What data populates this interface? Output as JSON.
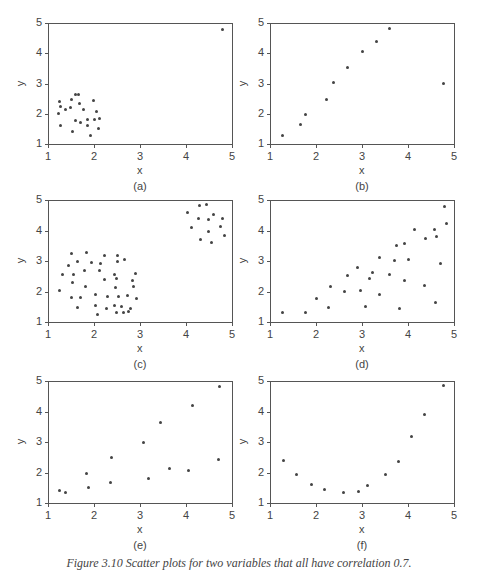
{
  "figure": {
    "caption": "Figure 3.10   Scatter plots for two variables that all have correlation 0.7.",
    "axis_color": "#555555",
    "point_color": "#444444"
  },
  "chart_data": [
    {
      "type": "scatter",
      "panel_label": "(a)",
      "xlabel": "x",
      "ylabel": "y",
      "xlim": [
        1,
        5
      ],
      "ylim": [
        1,
        5
      ],
      "xticks": [
        "1",
        "2",
        "3",
        "4",
        "5"
      ],
      "yticks": [
        "1",
        "2",
        "3",
        "4",
        "5"
      ],
      "grid": false,
      "points": [
        [
          4.8,
          4.78
        ],
        [
          1.26,
          2.39
        ],
        [
          1.27,
          2.24
        ],
        [
          1.22,
          2.0
        ],
        [
          1.27,
          1.62
        ],
        [
          1.38,
          2.15
        ],
        [
          1.48,
          2.2
        ],
        [
          1.51,
          2.47
        ],
        [
          1.6,
          2.63
        ],
        [
          1.67,
          2.63
        ],
        [
          1.69,
          2.35
        ],
        [
          1.77,
          2.15
        ],
        [
          1.59,
          1.77
        ],
        [
          1.7,
          1.71
        ],
        [
          1.54,
          1.42
        ],
        [
          1.86,
          1.81
        ],
        [
          1.85,
          1.62
        ],
        [
          1.92,
          1.28
        ],
        [
          1.98,
          2.43
        ],
        [
          2.05,
          2.08
        ],
        [
          2.01,
          1.82
        ],
        [
          2.13,
          1.84
        ],
        [
          2.09,
          1.5
        ]
      ]
    },
    {
      "type": "scatter",
      "panel_label": "(b)",
      "xlabel": "x",
      "ylabel": "y",
      "xlim": [
        1,
        5
      ],
      "ylim": [
        1,
        5
      ],
      "xticks": [
        "1",
        "2",
        "3",
        "4",
        "5"
      ],
      "yticks": [
        "1",
        "2",
        "3",
        "4",
        "5"
      ],
      "grid": false,
      "points": [
        [
          1.27,
          1.27
        ],
        [
          1.66,
          1.65
        ],
        [
          1.78,
          1.99
        ],
        [
          2.22,
          2.46
        ],
        [
          2.38,
          3.04
        ],
        [
          2.68,
          3.54
        ],
        [
          3.02,
          4.06
        ],
        [
          3.32,
          4.39
        ],
        [
          3.59,
          4.82
        ],
        [
          4.78,
          3.01
        ]
      ]
    },
    {
      "type": "scatter",
      "panel_label": "(c)",
      "xlabel": "x",
      "ylabel": "y",
      "xlim": [
        1,
        5
      ],
      "ylim": [
        1,
        5
      ],
      "xticks": [
        "1",
        "2",
        "3",
        "4",
        "5"
      ],
      "yticks": [
        "1",
        "2",
        "3",
        "4",
        "5"
      ],
      "grid": false,
      "points": [
        [
          4.04,
          4.58
        ],
        [
          4.3,
          4.81
        ],
        [
          4.45,
          4.86
        ],
        [
          4.27,
          4.39
        ],
        [
          4.59,
          4.53
        ],
        [
          4.48,
          4.35
        ],
        [
          4.12,
          4.1
        ],
        [
          4.48,
          3.98
        ],
        [
          4.32,
          3.72
        ],
        [
          4.56,
          3.6
        ],
        [
          4.8,
          4.38
        ],
        [
          4.76,
          4.13
        ],
        [
          4.83,
          3.85
        ],
        [
          1.25,
          2.02
        ],
        [
          1.31,
          2.55
        ],
        [
          1.45,
          2.86
        ],
        [
          1.51,
          3.25
        ],
        [
          1.55,
          2.55
        ],
        [
          1.54,
          2.28
        ],
        [
          1.51,
          1.81
        ],
        [
          1.65,
          2.97
        ],
        [
          1.65,
          1.49
        ],
        [
          1.71,
          1.81
        ],
        [
          1.8,
          2.7
        ],
        [
          1.82,
          2.16
        ],
        [
          1.84,
          3.27
        ],
        [
          1.94,
          2.96
        ],
        [
          2.03,
          1.89
        ],
        [
          2.03,
          1.53
        ],
        [
          2.07,
          1.24
        ],
        [
          2.11,
          2.69
        ],
        [
          2.14,
          2.92
        ],
        [
          2.22,
          3.18
        ],
        [
          2.22,
          2.38
        ],
        [
          2.3,
          1.85
        ],
        [
          2.27,
          1.45
        ],
        [
          2.45,
          2.57
        ],
        [
          2.48,
          2.43
        ],
        [
          2.46,
          2.13
        ],
        [
          2.45,
          1.53
        ],
        [
          2.52,
          3.18
        ],
        [
          2.52,
          2.97
        ],
        [
          2.54,
          1.83
        ],
        [
          2.49,
          1.3
        ],
        [
          2.6,
          1.5
        ],
        [
          2.66,
          3.06
        ],
        [
          2.65,
          1.3
        ],
        [
          2.73,
          1.87
        ],
        [
          2.76,
          1.36
        ],
        [
          2.8,
          1.45
        ],
        [
          2.83,
          2.36
        ],
        [
          2.86,
          2.18
        ],
        [
          2.9,
          2.58
        ],
        [
          2.93,
          1.76
        ]
      ]
    },
    {
      "type": "scatter",
      "panel_label": "(d)",
      "xlabel": "x",
      "ylabel": "y",
      "xlim": [
        1,
        5
      ],
      "ylim": [
        1,
        5
      ],
      "xticks": [
        "1",
        "2",
        "3",
        "4",
        "5"
      ],
      "yticks": [
        "1",
        "2",
        "3",
        "4",
        "5"
      ],
      "grid": false,
      "points": [
        [
          1.28,
          1.3
        ],
        [
          1.77,
          1.3
        ],
        [
          2.02,
          1.76
        ],
        [
          2.27,
          1.46
        ],
        [
          2.32,
          2.16
        ],
        [
          2.61,
          1.99
        ],
        [
          2.68,
          2.53
        ],
        [
          2.91,
          2.8
        ],
        [
          2.97,
          2.03
        ],
        [
          3.07,
          1.5
        ],
        [
          3.16,
          2.43
        ],
        [
          3.22,
          2.62
        ],
        [
          3.39,
          3.11
        ],
        [
          3.39,
          1.89
        ],
        [
          3.59,
          2.55
        ],
        [
          3.71,
          3.01
        ],
        [
          3.74,
          3.52
        ],
        [
          3.81,
          1.43
        ],
        [
          3.93,
          3.57
        ],
        [
          3.93,
          2.37
        ],
        [
          4.02,
          3.05
        ],
        [
          4.14,
          4.04
        ],
        [
          4.35,
          2.2
        ],
        [
          4.38,
          3.74
        ],
        [
          4.58,
          4.02
        ],
        [
          4.6,
          1.64
        ],
        [
          4.62,
          3.79
        ],
        [
          4.7,
          2.91
        ],
        [
          4.8,
          4.8
        ],
        [
          4.83,
          4.24
        ]
      ]
    },
    {
      "type": "scatter",
      "panel_label": "(e)",
      "xlabel": "x",
      "ylabel": "y",
      "xlim": [
        1,
        5
      ],
      "ylim": [
        1,
        5
      ],
      "xticks": [
        "1",
        "2",
        "3",
        "4",
        "5"
      ],
      "yticks": [
        "1",
        "2",
        "3",
        "4",
        "5"
      ],
      "grid": false,
      "points": [
        [
          1.26,
          1.41
        ],
        [
          1.38,
          1.33
        ],
        [
          1.84,
          1.98
        ],
        [
          1.89,
          1.52
        ],
        [
          2.36,
          1.66
        ],
        [
          2.39,
          2.5
        ],
        [
          3.08,
          2.98
        ],
        [
          3.19,
          1.8
        ],
        [
          3.45,
          3.65
        ],
        [
          3.65,
          2.12
        ],
        [
          4.05,
          2.05
        ],
        [
          4.14,
          4.19
        ],
        [
          4.7,
          2.43
        ],
        [
          4.73,
          4.81
        ]
      ]
    },
    {
      "type": "scatter",
      "panel_label": "(f)",
      "xlabel": "x",
      "ylabel": "y",
      "xlim": [
        1,
        5
      ],
      "ylim": [
        1,
        5
      ],
      "xticks": [
        "1",
        "2",
        "3",
        "4",
        "5"
      ],
      "yticks": [
        "1",
        "2",
        "3",
        "4",
        "5"
      ],
      "grid": false,
      "points": [
        [
          1.3,
          2.4
        ],
        [
          1.57,
          1.94
        ],
        [
          1.91,
          1.62
        ],
        [
          2.19,
          1.45
        ],
        [
          2.6,
          1.36
        ],
        [
          2.93,
          1.39
        ],
        [
          3.13,
          1.58
        ],
        [
          3.52,
          1.92
        ],
        [
          3.8,
          2.37
        ],
        [
          4.08,
          3.17
        ],
        [
          4.36,
          3.91
        ],
        [
          4.78,
          4.84
        ]
      ]
    }
  ]
}
